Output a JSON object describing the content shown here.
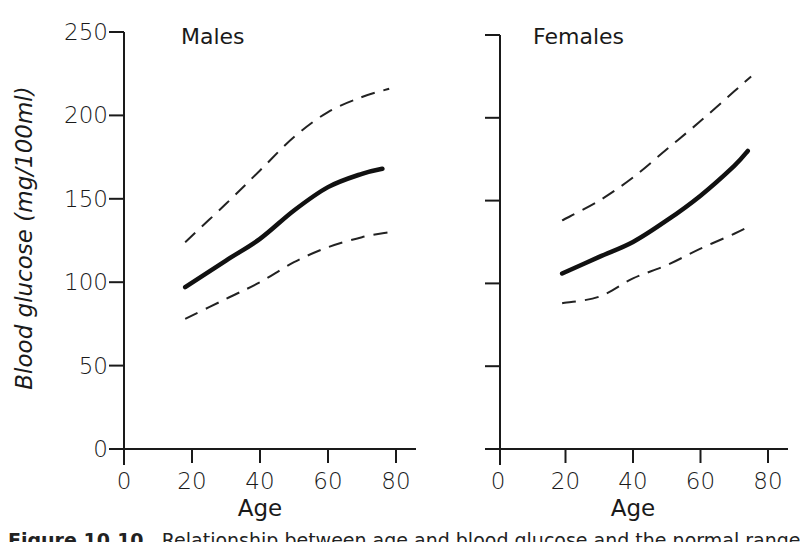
{
  "figure": {
    "ylabel": "Blood glucose (mg/100ml)",
    "caption_label": "Figure 10.10",
    "caption_text": "Relationship between age and blood glucose and the normal range"
  },
  "chart_data": [
    {
      "type": "line",
      "title": "Males",
      "xlabel": "Age",
      "ylabel": "Blood glucose (mg/100ml)",
      "xlim": [
        0,
        85
      ],
      "ylim": [
        0,
        250
      ],
      "xticks": [
        0,
        20,
        40,
        60,
        80
      ],
      "yticks": [
        0,
        50,
        100,
        150,
        200,
        250
      ],
      "grid": false,
      "x": [
        18,
        30,
        40,
        50,
        60,
        70,
        76
      ],
      "series": [
        {
          "name": "Mean",
          "style": "solid",
          "values": [
            97,
            113,
            126,
            143,
            157,
            165,
            168
          ]
        },
        {
          "name": "Upper limit",
          "style": "dashed",
          "x": [
            18,
            30,
            40,
            50,
            60,
            70,
            78
          ],
          "values": [
            124,
            147,
            167,
            187,
            202,
            211,
            216
          ]
        },
        {
          "name": "Lower limit",
          "style": "dashed",
          "x": [
            18,
            30,
            40,
            50,
            60,
            70,
            78
          ],
          "values": [
            78,
            90,
            100,
            112,
            121,
            127,
            130
          ]
        }
      ]
    },
    {
      "type": "line",
      "title": "Females",
      "xlabel": "Age",
      "ylabel": "",
      "xlim": [
        0,
        85
      ],
      "ylim": [
        0,
        250
      ],
      "xticks": [
        0,
        20,
        40,
        60,
        80
      ],
      "yticks": [
        0,
        50,
        100,
        150,
        200,
        250
      ],
      "grid": false,
      "x": [
        19,
        30,
        40,
        50,
        60,
        70,
        74
      ],
      "series": [
        {
          "name": "Mean",
          "style": "solid",
          "values": [
            106,
            116,
            125,
            138,
            153,
            171,
            180
          ]
        },
        {
          "name": "Upper limit",
          "style": "dashed",
          "x": [
            19,
            30,
            40,
            50,
            60,
            70,
            75
          ],
          "values": [
            138,
            150,
            164,
            181,
            198,
            216,
            225
          ]
        },
        {
          "name": "Lower limit",
          "style": "dashed",
          "x": [
            19,
            30,
            40,
            50,
            60,
            70,
            75
          ],
          "values": [
            88,
            92,
            103,
            111,
            121,
            130,
            135
          ]
        }
      ]
    }
  ]
}
